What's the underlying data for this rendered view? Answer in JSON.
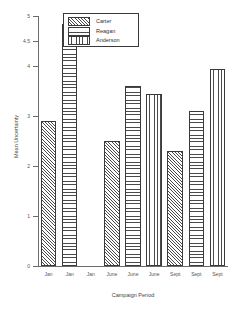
{
  "chart_data": {
    "type": "bar",
    "title": "",
    "xlabel": "Campaign Period",
    "ylabel": "Mean Uncertainty",
    "ylim": [
      0,
      5
    ],
    "grid": false,
    "legend_position": "top-left-inside",
    "categories": [
      "Jan",
      "June",
      "Sept"
    ],
    "x_tick_labels": [
      "Jan",
      "Jan",
      "Jan",
      "June",
      "June",
      "June",
      "Sept",
      "Sept",
      "Sept"
    ],
    "y_tick_labels": [
      "0",
      "1",
      "2",
      "3",
      "4",
      "4.5",
      "5"
    ],
    "y_tick_values": [
      0,
      1,
      2,
      3,
      4,
      4.5,
      5
    ],
    "series": [
      {
        "name": "Carter",
        "pattern": "diagonal-hatch",
        "values": [
          2.9,
          2.5,
          2.3
        ]
      },
      {
        "name": "Reagan",
        "pattern": "horizontal-lines",
        "values": [
          4.85,
          3.6,
          3.1
        ]
      },
      {
        "name": "Anderson",
        "pattern": "vertical-lines",
        "values": [
          null,
          3.45,
          3.95
        ]
      }
    ],
    "bars": [
      {
        "label": "Jan",
        "series": "Carter",
        "value": 2.9
      },
      {
        "label": "Jan",
        "series": "Reagan",
        "value": 4.85
      },
      {
        "label": "Jan",
        "series": "Anderson",
        "value": null
      },
      {
        "label": "June",
        "series": "Carter",
        "value": 2.5
      },
      {
        "label": "June",
        "series": "Reagan",
        "value": 3.6
      },
      {
        "label": "June",
        "series": "Anderson",
        "value": 3.45
      },
      {
        "label": "Sept",
        "series": "Carter",
        "value": 2.3
      },
      {
        "label": "Sept",
        "series": "Reagan",
        "value": 3.1
      },
      {
        "label": "Sept",
        "series": "Anderson",
        "value": 3.95
      }
    ]
  },
  "legend": {
    "entries": [
      {
        "label": "Carter"
      },
      {
        "label": "Reagan"
      },
      {
        "label": "Anderson"
      }
    ]
  },
  "colors": {
    "axis": "#6b6b6b",
    "bar_outline": "#3a3a3a",
    "bar_fill": "#ffffff",
    "pattern_ink": "#4a4a4a",
    "text": "#333333",
    "background": "#ffffff"
  }
}
